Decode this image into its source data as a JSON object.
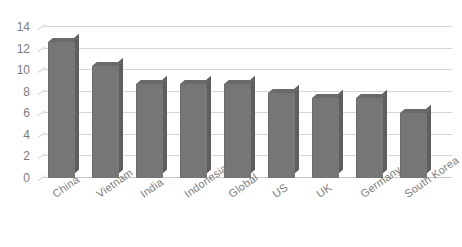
{
  "chart_data": {
    "type": "bar",
    "title": "",
    "subtitle": "",
    "xlabel": "",
    "ylabel": "",
    "categories": [
      "China",
      "Vietnam",
      "India",
      "Indonesia",
      "Global",
      "US",
      "UK",
      "Germany",
      "South Korea"
    ],
    "values": [
      12.6,
      10.4,
      8.7,
      8.7,
      8.7,
      7.9,
      7.4,
      7.4,
      6.0
    ],
    "ylim": [
      0,
      14
    ],
    "yticks": [
      "0",
      "2",
      "4",
      "6",
      "8",
      "10",
      "12",
      "14"
    ],
    "ytick_values": [
      0,
      2,
      4,
      6,
      8,
      10,
      12,
      14
    ],
    "grid": true,
    "legend": "none",
    "style": "3d-column",
    "series": [
      {
        "name": "",
        "values": [
          12.6,
          10.4,
          8.7,
          8.7,
          8.7,
          7.9,
          7.4,
          7.4,
          6.0
        ]
      }
    ]
  },
  "colors": {
    "bar_front": "#767676",
    "bar_side": "#5e5e5e",
    "bar_top": "#6a6a6a",
    "gridline": "#d6d6d6",
    "axis_text": "#7d7d7d",
    "background": "#ffffff"
  }
}
